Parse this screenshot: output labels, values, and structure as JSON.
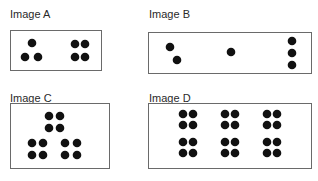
{
  "figure": {
    "panels": [
      {
        "id": "A",
        "label": "Image A",
        "label_pos": [
          10,
          8
        ],
        "box": {
          "x": 10,
          "y": 30,
          "w": 92,
          "h": 41
        },
        "dot_count": 7,
        "dot_radius": 4.3,
        "dots": [
          [
            32,
            43
          ],
          [
            25,
            57
          ],
          [
            38,
            57
          ],
          [
            75,
            44
          ],
          [
            85,
            44
          ],
          [
            75,
            57
          ],
          [
            85,
            57
          ]
        ]
      },
      {
        "id": "B",
        "label": "Image B",
        "label_pos": [
          149,
          8
        ],
        "box": {
          "x": 148,
          "y": 32,
          "w": 164,
          "h": 42
        },
        "dot_count": 6,
        "dot_radius": 4.3,
        "dots": [
          [
            170,
            47
          ],
          [
            177,
            60
          ],
          [
            231,
            52
          ],
          [
            292,
            41
          ],
          [
            292,
            53
          ],
          [
            292,
            65
          ]
        ]
      },
      {
        "id": "C",
        "label": "Image C",
        "label_pos": [
          10,
          92
        ],
        "box": {
          "x": 10,
          "y": 103,
          "w": 100,
          "h": 66
        },
        "dot_count": 12,
        "dot_radius": 4.3,
        "dots": [
          [
            49,
            116
          ],
          [
            60,
            116
          ],
          [
            49,
            128
          ],
          [
            60,
            128
          ],
          [
            32,
            143
          ],
          [
            43,
            143
          ],
          [
            32,
            155
          ],
          [
            43,
            155
          ],
          [
            65,
            143
          ],
          [
            77,
            143
          ],
          [
            65,
            155
          ],
          [
            77,
            155
          ]
        ]
      },
      {
        "id": "D",
        "label": "Image D",
        "label_pos": [
          149,
          92
        ],
        "box": {
          "x": 148,
          "y": 103,
          "w": 164,
          "h": 66
        },
        "dot_count": 24,
        "dot_radius": 4.3,
        "dots": [
          [
            183,
            114
          ],
          [
            193,
            114
          ],
          [
            183,
            125
          ],
          [
            193,
            125
          ],
          [
            225,
            114
          ],
          [
            235,
            114
          ],
          [
            225,
            125
          ],
          [
            235,
            125
          ],
          [
            267,
            114
          ],
          [
            277,
            114
          ],
          [
            267,
            125
          ],
          [
            277,
            125
          ],
          [
            183,
            142
          ],
          [
            193,
            142
          ],
          [
            183,
            153
          ],
          [
            193,
            153
          ],
          [
            225,
            142
          ],
          [
            235,
            142
          ],
          [
            225,
            153
          ],
          [
            235,
            153
          ],
          [
            267,
            142
          ],
          [
            277,
            142
          ],
          [
            267,
            153
          ],
          [
            277,
            153
          ]
        ]
      }
    ],
    "colors": {
      "dot": "#111111",
      "border": "#6a6a6a",
      "background": "#ffffff",
      "label": "#2a2a2a"
    }
  }
}
